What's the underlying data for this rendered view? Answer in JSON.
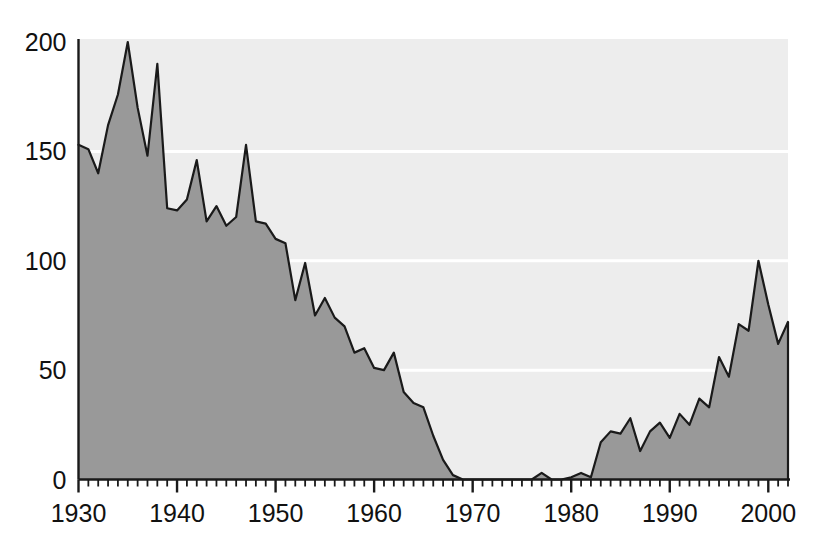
{
  "chart_data": {
    "type": "area",
    "title": "",
    "subtitle": "",
    "xlabel": "",
    "ylabel": "",
    "xlim": [
      1930,
      2002
    ],
    "ylim": [
      0,
      200
    ],
    "yticks": [
      0,
      50,
      100,
      150,
      200
    ],
    "ytick_labels": [
      "0",
      "50",
      "100",
      "150",
      "200"
    ],
    "xticks": [
      1930,
      1940,
      1950,
      1960,
      1970,
      1980,
      1990,
      2000
    ],
    "xtick_labels": [
      "1930",
      "1940",
      "1950",
      "1960",
      "1970",
      "1980",
      "1990",
      "2000"
    ],
    "minor_xtick_interval": 1,
    "grid": "horizontal white gridlines at 50, 100, 150",
    "legend": "none",
    "annotations": [],
    "colors": {
      "area_fill": "#999999",
      "plot_background": "#ededed",
      "line": "#1a1a1a",
      "gridline": "#ffffff",
      "axis": "#1a1a1a",
      "tick_label": "#111111",
      "page_background": "#ffffff"
    },
    "series": [
      {
        "name": "value",
        "x": [
          1930,
          1931,
          1932,
          1933,
          1934,
          1935,
          1936,
          1937,
          1938,
          1939,
          1940,
          1941,
          1942,
          1943,
          1944,
          1945,
          1946,
          1947,
          1948,
          1949,
          1950,
          1951,
          1952,
          1953,
          1954,
          1955,
          1956,
          1957,
          1958,
          1959,
          1960,
          1961,
          1962,
          1963,
          1964,
          1965,
          1966,
          1967,
          1968,
          1969,
          1970,
          1971,
          1972,
          1973,
          1974,
          1975,
          1976,
          1977,
          1978,
          1979,
          1980,
          1981,
          1982,
          1983,
          1984,
          1985,
          1986,
          1987,
          1988,
          1989,
          1990,
          1991,
          1992,
          1993,
          1994,
          1995,
          1996,
          1997,
          1998,
          1999,
          2000,
          2001,
          2002
        ],
        "values": [
          153,
          151,
          140,
          162,
          176,
          200,
          170,
          148,
          190,
          124,
          123,
          128,
          146,
          118,
          125,
          116,
          120,
          153,
          118,
          117,
          110,
          108,
          82,
          99,
          75,
          83,
          74,
          70,
          58,
          60,
          51,
          50,
          58,
          40,
          35,
          33,
          20,
          9,
          2,
          0,
          0,
          0,
          0,
          0,
          0,
          0,
          0,
          3,
          0,
          0,
          1,
          3,
          1,
          17,
          22,
          21,
          28,
          13,
          22,
          26,
          19,
          30,
          25,
          37,
          33,
          56,
          47,
          71,
          68,
          100,
          80,
          62,
          72
        ]
      }
    ]
  },
  "axes": {
    "y_axis_name": "y-axis",
    "x_axis_name": "x-axis"
  }
}
